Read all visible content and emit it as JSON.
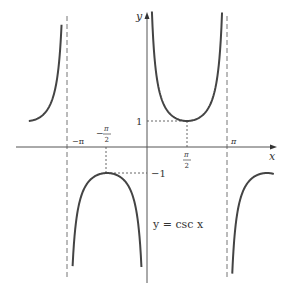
{
  "chart_data": {
    "type": "line",
    "title": "",
    "equation_label": "y = csc x",
    "xlabel": "x",
    "ylabel": "y",
    "x_ticks": [
      {
        "value": -3.14159,
        "label": "−π"
      },
      {
        "value": -1.5708,
        "label": "−π/2",
        "num": "π",
        "den": "2",
        "neg": true
      },
      {
        "value": 1.5708,
        "label": "π/2",
        "num": "π",
        "den": "2",
        "neg": false
      },
      {
        "value": 3.14159,
        "label": "π"
      }
    ],
    "y_ticks": [
      {
        "value": 1,
        "label": "1"
      },
      {
        "value": -1,
        "label": "−1"
      }
    ],
    "asymptotes": [
      -3.14159,
      3.14159
    ],
    "series": [
      {
        "name": "csc x",
        "function": "1/sin(x)",
        "branches": [
          [
            -4.64,
            -3.2
          ],
          [
            0.05,
            3.08
          ],
          [
            3.2,
            4.7
          ],
          [
            -3.1,
            -0.05
          ]
        ]
      }
    ],
    "reference_points": [
      {
        "x": 1.5708,
        "y": 1,
        "label": "local min (π/2, 1)"
      },
      {
        "x": -1.5708,
        "y": -1,
        "label": "local max (−π/2, −1)"
      }
    ],
    "xlim": [
      -4.6,
      4.2
    ],
    "ylim": [
      -5.2,
      5.3
    ],
    "grid": false,
    "legend": null
  },
  "labels": {
    "x_axis": "x",
    "y_axis": "y",
    "neg_pi": "−π",
    "pi": "π",
    "pi_sym": "π",
    "two": "2",
    "minus": "−",
    "one": "1",
    "neg_one": "−1",
    "equation": "y = csc x"
  }
}
